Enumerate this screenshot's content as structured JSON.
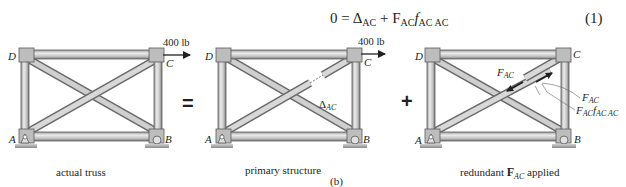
{
  "equation": {
    "lhs": "0",
    "equals": "=",
    "delta_symbol": "Δ",
    "delta_sub": "AC",
    "plus": "+",
    "force_symbol": "F",
    "force_sub": "AC",
    "flex_symbol": "f",
    "flex_sub": "AC AC",
    "number": "(1)"
  },
  "figure_label": "(b)",
  "operators": {
    "equals": "=",
    "plus": "+"
  },
  "panels": [
    {
      "caption": "actual truss",
      "joints": {
        "A": "A",
        "B": "B",
        "C": "C",
        "D": "D"
      },
      "load": "400 lb"
    },
    {
      "caption": "primary structure",
      "joints": {
        "A": "A",
        "B": "B",
        "C": "C",
        "D": "D"
      },
      "load": "400 lb",
      "gap_label_main": "Δ",
      "gap_label_sub": "AC"
    },
    {
      "caption_pre": "redundant ",
      "caption_bold": "F",
      "caption_sub": "AC",
      "caption_post": " applied",
      "joints": {
        "A": "A",
        "B": "B",
        "C": "C",
        "D": "D"
      },
      "force_label_main": "F",
      "force_label_sub": "AC",
      "callout_1_main": "F",
      "callout_1_sub": "AC",
      "callout_2_main": "F",
      "callout_2_sub1": "AC",
      "callout_2_f": "f",
      "callout_2_sub2": "AC AC"
    }
  ],
  "colors": {
    "member_light": "#d9d9d9",
    "member_dark": "#8c8c8c",
    "member_edge": "#5a5a5a",
    "plate": "#bdbdbd",
    "ink": "#231f20"
  }
}
